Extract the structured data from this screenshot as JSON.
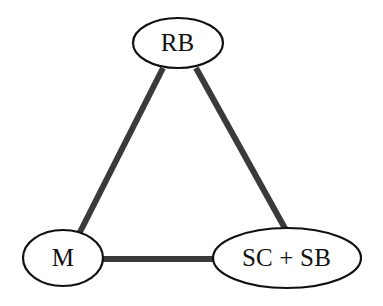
{
  "figure": {
    "type": "node-link-diagram",
    "shape": "triangle",
    "background_color": "#ffffff",
    "node_fill_color": "#ffffff",
    "node_stroke_color": "#101010",
    "edge_color": "#3a3a3a"
  },
  "nodes": [
    {
      "id": "rb",
      "label": "RB",
      "position": "top",
      "center_x": 178,
      "center_y": 43,
      "radius_x": 45,
      "radius_y": 25
    },
    {
      "id": "m",
      "label": "M",
      "position": "bottom-left",
      "center_x": 63,
      "center_y": 258,
      "radius_x": 40,
      "radius_y": 28
    },
    {
      "id": "scsb",
      "label": "SC + SB",
      "position": "bottom-right",
      "center_x": 287,
      "center_y": 258,
      "radius_x": 74,
      "radius_y": 30
    }
  ],
  "edges": [
    {
      "id": "rb-m",
      "from": "rb",
      "to": "m",
      "orientation": "diagonal-left",
      "x1": 163,
      "y1": 68,
      "x2": 79,
      "y2": 234,
      "width": 6
    },
    {
      "id": "rb-scsb",
      "from": "rb",
      "to": "scsb",
      "orientation": "diagonal-right",
      "x1": 196,
      "y1": 68,
      "x2": 287,
      "y2": 232,
      "width": 6
    },
    {
      "id": "m-scsb",
      "from": "m",
      "to": "scsb",
      "orientation": "horizontal",
      "x1": 101,
      "y1": 259,
      "x2": 215,
      "y2": 259,
      "width": 6
    }
  ]
}
